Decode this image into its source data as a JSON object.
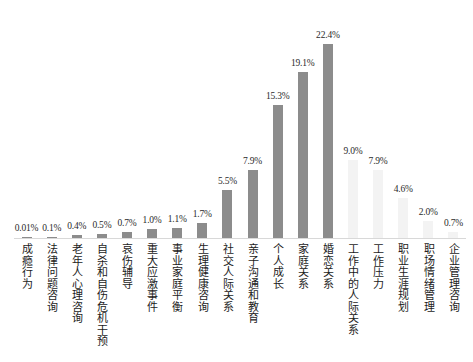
{
  "chart_data": {
    "type": "bar",
    "title": "",
    "subtitle": "",
    "xlabel": "",
    "ylabel": "",
    "ylim": [
      0,
      24
    ],
    "grid": false,
    "legend": null,
    "value_suffix": "%",
    "colors": {
      "bar_dark": "#8c8c8c",
      "bar_light": "#f3f3f3",
      "axis": "#d8d8d8",
      "text": "#1c1c1c"
    },
    "categories": [
      "成瘾行为",
      "法律问题咨询",
      "老年人心理咨询",
      "自杀和自伤危机干预",
      "哀伤辅导",
      "重大应激事件",
      "事业家庭平衡",
      "生理健康咨询",
      "社交人际关系",
      "亲子沟通和教育",
      "个人成长",
      "家庭关系",
      "婚恋关系",
      "工作中的人际关系",
      "工作压力",
      "职业生涯规划",
      "职场情绪管理",
      "企业管理咨询"
    ],
    "values": [
      0.01,
      0.1,
      0.4,
      0.5,
      0.7,
      1.0,
      1.1,
      1.7,
      5.5,
      7.9,
      15.3,
      19.1,
      22.4,
      9.0,
      7.9,
      4.6,
      2.0,
      0.7
    ],
    "value_labels": [
      "0.01%",
      "0.1%",
      "0.4%",
      "0.5%",
      "0.7%",
      "1.0%",
      "1.1%",
      "1.7%",
      "5.5%",
      "7.9%",
      "15.3%",
      "19.1%",
      "22.4%",
      "9.0%",
      "7.9%",
      "4.6%",
      "2.0%",
      "0.7%"
    ],
    "series_styles": [
      "dark",
      "dark",
      "dark",
      "dark",
      "dark",
      "dark",
      "dark",
      "dark",
      "dark",
      "dark",
      "dark",
      "dark",
      "dark",
      "light",
      "light",
      "light",
      "light",
      "light"
    ]
  }
}
